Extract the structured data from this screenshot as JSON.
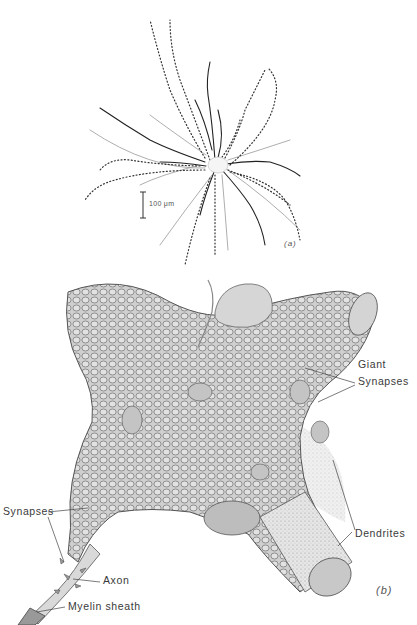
{
  "figure": {
    "panel_a": {
      "tag": "(a)",
      "scale_bar_label": "100 μm",
      "description": "Golgi-stained neuron with radiating dendrites (dotted and solid traces)"
    },
    "panel_b": {
      "tag": "(b)",
      "description": "3D drawing of neuron cell body covered with synaptic boutons",
      "labels": {
        "giant_synapses_line1": "Giant",
        "giant_synapses_line2": "Synapses",
        "synapses": "Synapses",
        "axon": "Axon",
        "myelin_sheath": "Myelin sheath",
        "dendrites": "Dendrites"
      }
    }
  }
}
